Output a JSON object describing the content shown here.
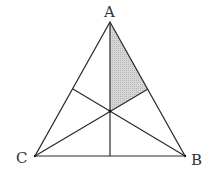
{
  "diagram": {
    "type": "geometry",
    "colors": {
      "line": "#2a2a2a",
      "shade": "#c8c8c8",
      "background": "#ffffff",
      "label": "#333333"
    },
    "vertices": {
      "A": {
        "label": "A",
        "x": 110,
        "y": 22
      },
      "B": {
        "label": "B",
        "x": 185,
        "y": 156
      },
      "C": {
        "label": "C",
        "x": 35,
        "y": 156
      }
    },
    "labels": {
      "A": "A",
      "B": "B",
      "C": "C"
    },
    "points": {
      "centroid": {
        "x": 110,
        "y": 111
      },
      "mid_AB": {
        "x": 148,
        "y": 89
      },
      "mid_AC": {
        "x": 73,
        "y": 89
      },
      "mid_BC": {
        "x": 110,
        "y": 156
      }
    },
    "shaded_region": [
      "A",
      "centroid",
      "mid_AB"
    ]
  }
}
